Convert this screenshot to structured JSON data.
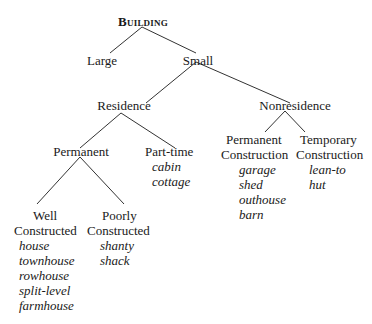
{
  "diagram": {
    "type": "tree",
    "root": {
      "label": "Building"
    },
    "level1": {
      "large": "Large",
      "small": "Small"
    },
    "level2": {
      "residence": "Residence",
      "nonresidence": "Nonresidence"
    },
    "residence_children": {
      "permanent": "Permanent",
      "part_time": {
        "label": "Part-time",
        "examples": [
          "cabin",
          "cottage"
        ]
      }
    },
    "permanent_children": {
      "well": {
        "label_line1": "Well",
        "label_line2": "Constructed",
        "examples": [
          "house",
          "townhouse",
          "rowhouse",
          "split-level",
          "farmhouse"
        ]
      },
      "poorly": {
        "label_line1": "Poorly",
        "label_line2": "Constructed",
        "examples": [
          "shanty",
          "shack"
        ]
      }
    },
    "nonresidence_children": {
      "permanent_construction": {
        "label_line1": "Permanent",
        "label_line2": "Construction",
        "examples": [
          "garage",
          "shed",
          "outhouse",
          "barn"
        ]
      },
      "temporary_construction": {
        "label_line1": "Temporary",
        "label_line2": "Construction",
        "examples": [
          "lean-to",
          "hut"
        ]
      }
    },
    "colors": {
      "text": "#1a1a1a",
      "lines": "#333333",
      "background": "#ffffff"
    }
  }
}
